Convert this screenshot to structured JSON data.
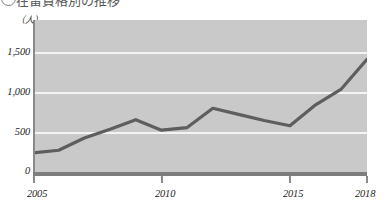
{
  "heading": {
    "bullet": "circled-number",
    "text": "在留資格別の推移"
  },
  "chart_data": {
    "type": "line",
    "title": "",
    "xlabel": "",
    "ylabel": "",
    "y_unit_label": "（人）",
    "x": [
      2005,
      2006,
      2007,
      2008,
      2009,
      2010,
      2011,
      2012,
      2013,
      2014,
      2015,
      2016,
      2017,
      2018
    ],
    "values": [
      230,
      260,
      400,
      500,
      610,
      490,
      520,
      740,
      670,
      600,
      540,
      780,
      960,
      1300
    ],
    "series": [
      {
        "name": "人数",
        "values": [
          230,
          260,
          400,
          500,
          610,
          490,
          520,
          740,
          670,
          600,
          540,
          780,
          960,
          1300
        ]
      }
    ],
    "xlim": [
      2005,
      2018
    ],
    "ylim": [
      0,
      1750
    ],
    "x_tick_labels": [
      "2005",
      "2010",
      "2015",
      "2018"
    ],
    "x_tick_values": [
      2005,
      2010,
      2015,
      2018
    ],
    "y_tick_labels": [
      "0",
      "500",
      "1,000",
      "1,500"
    ],
    "y_tick_values": [
      0,
      500,
      1000,
      1500
    ],
    "grid": true,
    "grid_color": "#f4f4f4",
    "legend": "none",
    "line_color": "#5e5e5e",
    "plot_background": "#c9c9c9",
    "axis_color": "#7d7d7d"
  }
}
